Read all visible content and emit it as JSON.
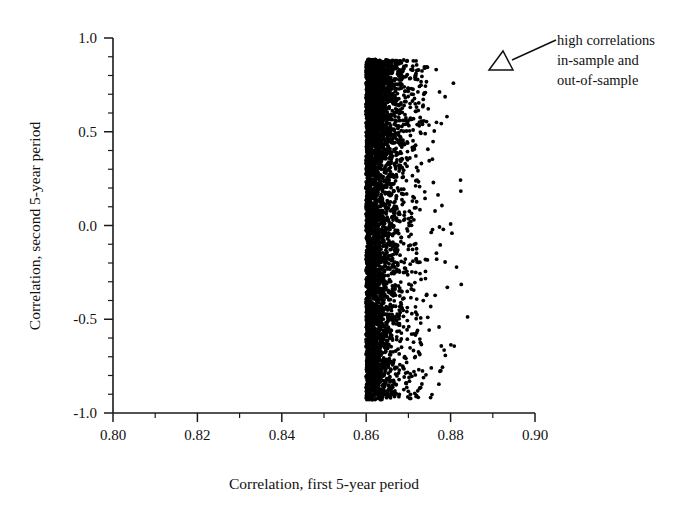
{
  "figure": {
    "title": "",
    "background_color": "#ffffff",
    "ink_color": "#000000"
  },
  "annotation": {
    "name": "high-correlations-callout",
    "line1": "high correlations",
    "line2": "in-sample and",
    "line3": "out-of-sample",
    "arrow_style": "hollow-triangle",
    "points_to": "right edge of scatter cloud"
  },
  "chart_data": {
    "type": "scatter",
    "title": "",
    "xlabel": "Correlation, first 5-year period",
    "ylabel": "Correlation, second 5-year period",
    "xlim": [
      0.8,
      0.9
    ],
    "ylim": [
      -1.0,
      1.0
    ],
    "grid": false,
    "legend": null,
    "marker": "filled-circle",
    "marker_color": "#000000",
    "xticks": [
      0.8,
      0.82,
      0.84,
      0.86,
      0.88,
      0.9
    ],
    "xtick_labels": [
      "0.80",
      "0.82",
      "0.84",
      "0.86",
      "0.88",
      "0.90"
    ],
    "xminor_ticks": [
      0.81,
      0.83,
      0.85,
      0.87,
      0.89
    ],
    "yticks": [
      -1.0,
      -0.5,
      0.0,
      0.5,
      1.0
    ],
    "ytick_labels": [
      "-1.0",
      "-0.5",
      "0.0",
      "0.5",
      "1.0"
    ],
    "yminor_ticks": [
      -0.9,
      -0.8,
      -0.7,
      -0.6,
      -0.4,
      -0.3,
      -0.2,
      -0.1,
      0.1,
      0.2,
      0.3,
      0.4,
      0.6,
      0.7,
      0.8,
      0.9
    ],
    "n_points": 4200,
    "cloud_description": "Dense vertical wall of points at x=0.860 spanning y=-0.93 to y=0.88, density decaying exponentially to the right up to about x=0.893; no points left of x=0.860.",
    "x_min_observed": 0.86,
    "x_max_observed": 0.893,
    "x_mode": 0.8605,
    "y_min_observed": -0.93,
    "y_max_observed": 0.885,
    "seed": 20240517
  }
}
